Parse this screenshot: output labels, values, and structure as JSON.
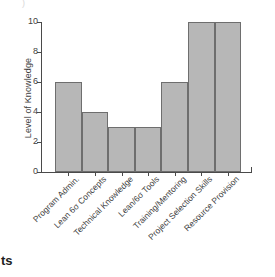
{
  "chart_data": {
    "type": "bar",
    "title": "",
    "xlabel": "",
    "ylabel": "Level of Knowledge",
    "ylim": [
      0,
      10
    ],
    "yticks": [
      0,
      2,
      4,
      6,
      8,
      10
    ],
    "grid": false,
    "legend": "none",
    "orientation": "vertical",
    "bar_color": "#b7b7b7",
    "bar_border_color": "#6e6e6e",
    "axis_color": "#4a4a4a",
    "categories": [
      "Program Admin.",
      "Lean 6σ Concepts",
      "Technical Knowledge",
      "Lean/6σ Tools",
      "Training/Mentoring",
      "Project Selection Skills",
      "Resource Provision"
    ],
    "values": [
      6,
      4,
      3,
      3,
      6,
      10,
      10
    ],
    "x_tick_label_rotation": -45
  },
  "annotations": {
    "caption_fragment": "ts",
    "top_fragment": ")"
  }
}
